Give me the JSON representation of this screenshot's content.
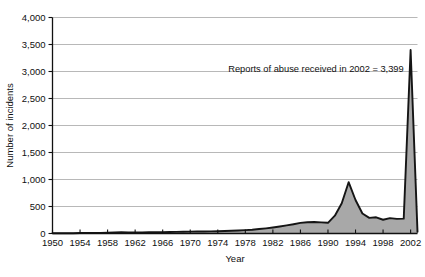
{
  "chart_data": {
    "type": "area",
    "title": "",
    "xlabel": "Year",
    "ylabel": "Number of incidents",
    "xlim": [
      1950,
      2003
    ],
    "ylim": [
      0,
      4000
    ],
    "grid": true,
    "legend": "none",
    "series_name": "Number of incidents",
    "area_fill_color": "#a8a8a8",
    "line_color": "#151515",
    "grid_color": "#9a9a9a",
    "axis_color": "#111111",
    "yticks": [
      0,
      500,
      1000,
      1500,
      2000,
      2500,
      3000,
      3500,
      4000
    ],
    "ytick_labels": [
      "0",
      "500",
      "1,000",
      "1,500",
      "2,000",
      "2,500",
      "3,000",
      "3,500",
      "4,000"
    ],
    "xticks": [
      1950,
      1954,
      1958,
      1962,
      1966,
      1970,
      1974,
      1978,
      1982,
      1986,
      1990,
      1994,
      1998,
      2002
    ],
    "xtick_labels": [
      "1950",
      "1954",
      "1958",
      "1962",
      "1966",
      "1970",
      "1974",
      "1978",
      "1982",
      "1986",
      "1990",
      "1994",
      "1998",
      "2002"
    ],
    "annotations": [
      {
        "text": "Reports of abuse received in 2002 = 3,399",
        "x": 2001,
        "y": 3000
      }
    ],
    "x": [
      1950,
      1951,
      1952,
      1953,
      1954,
      1955,
      1956,
      1957,
      1958,
      1959,
      1960,
      1961,
      1962,
      1963,
      1964,
      1965,
      1966,
      1967,
      1968,
      1969,
      1970,
      1971,
      1972,
      1973,
      1974,
      1975,
      1976,
      1977,
      1978,
      1979,
      1980,
      1981,
      1982,
      1983,
      1984,
      1985,
      1986,
      1987,
      1988,
      1989,
      1990,
      1991,
      1992,
      1993,
      1994,
      1995,
      1996,
      1997,
      1998,
      1999,
      2000,
      2001,
      2002,
      2003
    ],
    "values": [
      4,
      5,
      6,
      6,
      8,
      9,
      10,
      12,
      14,
      18,
      22,
      20,
      18,
      20,
      22,
      24,
      26,
      28,
      30,
      32,
      34,
      36,
      38,
      40,
      42,
      46,
      50,
      56,
      62,
      70,
      82,
      96,
      112,
      130,
      150,
      172,
      196,
      208,
      212,
      206,
      198,
      330,
      560,
      950,
      620,
      370,
      290,
      300,
      255,
      285,
      270,
      275,
      3399,
      30
    ]
  }
}
